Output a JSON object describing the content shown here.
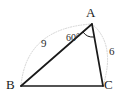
{
  "figure": {
    "type": "geometry-triangle-diagram",
    "vertices": [
      {
        "name": "A",
        "label": "A",
        "x": 92,
        "y": 24
      },
      {
        "name": "B",
        "label": "B",
        "x": 21,
        "y": 86
      },
      {
        "name": "C",
        "label": "C",
        "x": 103,
        "y": 86
      }
    ],
    "sides": [
      {
        "name": "AB",
        "label": "9",
        "from": "A",
        "to": "B"
      },
      {
        "name": "AC",
        "label": "6",
        "from": "A",
        "to": "C"
      },
      {
        "name": "BC",
        "label": "",
        "from": "B",
        "to": "C"
      }
    ],
    "angles": [
      {
        "at": "A",
        "label": "60°",
        "value": 60,
        "unit": "degrees"
      }
    ],
    "colors": {
      "stroke": "#1a1a1a",
      "text": "#1a1a1a",
      "guide": "#cfcfcf",
      "background": "#ffffff"
    },
    "guides": [
      {
        "name": "arc-b-to-a",
        "description": "faint dotted arc sweeping from B up over to A"
      },
      {
        "name": "arc-a-to-c",
        "description": "faint dotted arc sweeping from A right down to C"
      }
    ]
  }
}
